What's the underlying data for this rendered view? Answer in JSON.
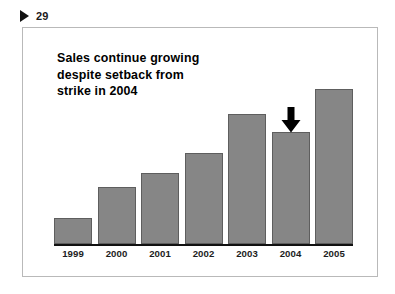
{
  "page": {
    "marker_icon": "play-triangle-icon",
    "number": "29"
  },
  "slide": {
    "title_lines": [
      "Sales continue growing",
      "despite setback from",
      "strike in 2004"
    ],
    "title_full": "Sales continue growing despite setback from strike in 2004"
  },
  "annotation": {
    "icon": "down-arrow-icon",
    "target_category": "2004",
    "color": "#000000"
  },
  "colors": {
    "bar_fill": "#868686",
    "bar_stroke": "#5e5e5e",
    "axis": "#111111",
    "text": "#000000",
    "frame": "#b9b9b9",
    "background": "#ffffff"
  },
  "chart_data": {
    "type": "bar",
    "title": "Sales continue growing despite setback from strike in 2004",
    "categories": [
      "1999",
      "2000",
      "2001",
      "2002",
      "2003",
      "2004",
      "2005"
    ],
    "values": [
      26,
      57,
      71,
      91,
      130,
      112,
      155
    ],
    "xlabel": "",
    "ylabel": "",
    "ylim": [
      0,
      206
    ],
    "grid": false,
    "legend": false,
    "annotations": [
      {
        "type": "arrow",
        "direction": "down",
        "category": "2004",
        "note": "setback from strike"
      }
    ]
  }
}
